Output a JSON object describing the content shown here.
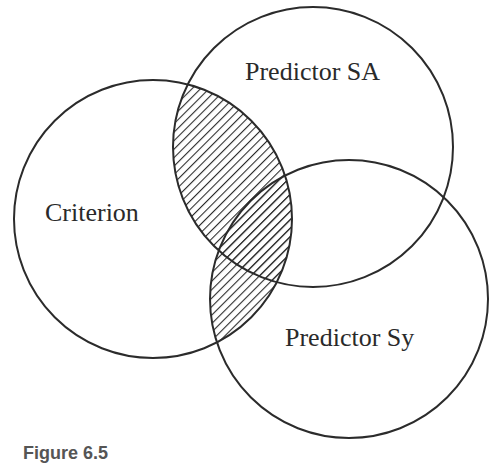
{
  "diagram": {
    "type": "venn",
    "circles": [
      {
        "id": "criterion",
        "label": "Criterion",
        "cx": 153,
        "cy": 219,
        "r": 139
      },
      {
        "id": "predictor_sa",
        "label": "Predictor SA",
        "cx": 313,
        "cy": 147,
        "r": 140
      },
      {
        "id": "predictor_sy",
        "label": "Predictor Sy",
        "cx": 349,
        "cy": 299,
        "r": 139
      }
    ],
    "shaded_region": "Criterion ∩ (Predictor SA ∪ Predictor Sy)",
    "shading": "diagonal-hatch",
    "stroke_color": "#2b2b2b"
  },
  "labels": {
    "criterion": "Criterion",
    "predictor_sa": "Predictor SA",
    "predictor_sy": "Predictor Sy"
  },
  "caption": "Figure 6.5"
}
